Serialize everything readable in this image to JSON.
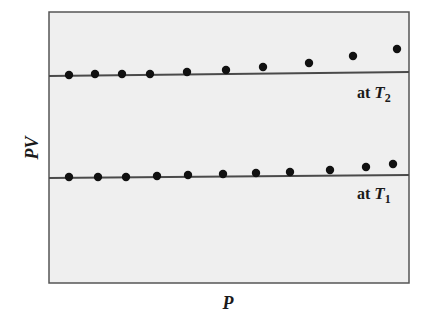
{
  "chart_data": {
    "type": "scatter",
    "title": "",
    "xlabel": "P",
    "ylabel": "PV",
    "grid": false,
    "legend": "none (inline labels under reference lines)",
    "axis_ticks": "none",
    "series": [
      {
        "name": "at T2",
        "label_prefix": "at ",
        "label_var": "T",
        "label_sub": "2",
        "reference_line_y_px": 74,
        "points_px": [
          [
            69,
            75
          ],
          [
            95,
            74
          ],
          [
            122,
            74
          ],
          [
            150,
            74
          ],
          [
            187,
            72
          ],
          [
            226,
            70
          ],
          [
            263,
            67
          ],
          [
            309,
            63
          ],
          [
            353,
            56
          ],
          [
            397,
            49
          ]
        ]
      },
      {
        "name": "at T1",
        "label_prefix": "at ",
        "label_var": "T",
        "label_sub": "1",
        "reference_line_y_px": 176,
        "points_px": [
          [
            69,
            177
          ],
          [
            98,
            177
          ],
          [
            126,
            177
          ],
          [
            157,
            176
          ],
          [
            188,
            175
          ],
          [
            223,
            174
          ],
          [
            256,
            173
          ],
          [
            290,
            172
          ],
          [
            330,
            170
          ],
          [
            366,
            167
          ],
          [
            393,
            164
          ]
        ]
      }
    ]
  },
  "labels": {
    "x_axis": "P",
    "y_axis": "PV",
    "t2_prefix": "at ",
    "t2_var": "T",
    "t2_sub": "2",
    "t1_prefix": "at ",
    "t1_var": "T",
    "t1_sub": "1"
  },
  "colors": {
    "plot_background": "#efefef",
    "frame": "#555555",
    "line": "#4a4a4a",
    "points": "#111111"
  }
}
